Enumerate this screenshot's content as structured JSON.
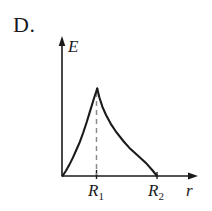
{
  "figure": {
    "option_label": "D.",
    "background_color": "#ffffff",
    "ink_color": "#1a1a1a",
    "dash_color": "#8a8a8a"
  },
  "chart_data": {
    "type": "line",
    "title": "",
    "subtitle": "",
    "xlabel": "r",
    "ylabel": "E",
    "grid": false,
    "legend": null,
    "annotations": [
      {
        "name": "dashed-peak-line",
        "x": "R_1",
        "from_y": 0,
        "to_y": "E_max",
        "style": "dashed"
      }
    ],
    "axis": {
      "x_arrow": true,
      "y_arrow": true,
      "x_origin_label": "",
      "xlim": [
        "0",
        "r_max"
      ],
      "ylim": [
        "0",
        "E_peak"
      ]
    },
    "tick_labels": {
      "x": [
        "R_1",
        "R_2"
      ],
      "x_display": [
        "R",
        "R"
      ],
      "x_subscripts": [
        "1",
        "2"
      ],
      "y": []
    },
    "series": [
      {
        "name": "E(r)",
        "x": [
          0.0,
          0.1,
          0.2,
          0.3,
          0.4,
          0.5,
          0.6,
          0.7,
          0.8,
          0.9,
          1.0,
          1.06,
          1.15,
          1.25,
          1.4,
          1.55,
          1.75,
          1.95,
          2.15,
          2.4,
          2.6,
          2.72
        ],
        "y": [
          0.0,
          0.06,
          0.13,
          0.21,
          0.3,
          0.39,
          0.5,
          0.62,
          0.75,
          0.88,
          1.0,
          0.9,
          0.79,
          0.7,
          0.59,
          0.5,
          0.4,
          0.31,
          0.24,
          0.15,
          0.06,
          0.0
        ],
        "x_peak": 1.0,
        "y_peak": 1.0,
        "x_zero_right": 2.72
      }
    ]
  }
}
